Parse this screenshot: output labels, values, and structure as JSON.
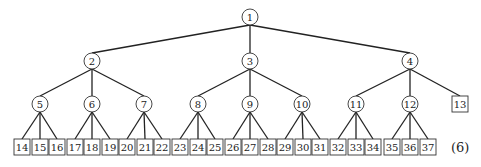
{
  "diagram": {
    "type": "tree",
    "equation_label": "(6)",
    "internal_nodes": [
      {
        "id": "1",
        "x": 250,
        "y": 17,
        "parent": null
      },
      {
        "id": "2",
        "x": 92,
        "y": 61,
        "parent": "1"
      },
      {
        "id": "3",
        "x": 250,
        "y": 61,
        "parent": "1"
      },
      {
        "id": "4",
        "x": 410,
        "y": 61,
        "parent": "1"
      },
      {
        "id": "5",
        "x": 40,
        "y": 104,
        "parent": "2"
      },
      {
        "id": "6",
        "x": 92,
        "y": 104,
        "parent": "2"
      },
      {
        "id": "7",
        "x": 144,
        "y": 104,
        "parent": "2"
      },
      {
        "id": "8",
        "x": 198,
        "y": 104,
        "parent": "3"
      },
      {
        "id": "9",
        "x": 250,
        "y": 104,
        "parent": "3"
      },
      {
        "id": "10",
        "x": 302,
        "y": 104,
        "parent": "3"
      },
      {
        "id": "11",
        "x": 356,
        "y": 104,
        "parent": "4"
      },
      {
        "id": "12",
        "x": 410,
        "y": 104,
        "parent": "4"
      }
    ],
    "leaf_nodes": [
      {
        "id": "13",
        "x": 460,
        "y": 104,
        "parent": "4"
      },
      {
        "id": "14",
        "x": 22,
        "y": 147,
        "parent": "5"
      },
      {
        "id": "15",
        "x": 40,
        "y": 147,
        "parent": "5"
      },
      {
        "id": "16",
        "x": 57,
        "y": 147,
        "parent": "5"
      },
      {
        "id": "17",
        "x": 75,
        "y": 147,
        "parent": "6"
      },
      {
        "id": "18",
        "x": 92,
        "y": 147,
        "parent": "6"
      },
      {
        "id": "19",
        "x": 110,
        "y": 147,
        "parent": "6"
      },
      {
        "id": "20",
        "x": 127,
        "y": 147,
        "parent": "7"
      },
      {
        "id": "21",
        "x": 145,
        "y": 147,
        "parent": "7"
      },
      {
        "id": "22",
        "x": 162,
        "y": 147,
        "parent": "7"
      },
      {
        "id": "23",
        "x": 180,
        "y": 147,
        "parent": "8"
      },
      {
        "id": "24",
        "x": 198,
        "y": 147,
        "parent": "8"
      },
      {
        "id": "25",
        "x": 215,
        "y": 147,
        "parent": "8"
      },
      {
        "id": "26",
        "x": 233,
        "y": 147,
        "parent": "9"
      },
      {
        "id": "27",
        "x": 250,
        "y": 147,
        "parent": "9"
      },
      {
        "id": "28",
        "x": 268,
        "y": 147,
        "parent": "9"
      },
      {
        "id": "29",
        "x": 285,
        "y": 147,
        "parent": "10"
      },
      {
        "id": "30",
        "x": 303,
        "y": 147,
        "parent": "10"
      },
      {
        "id": "31",
        "x": 320,
        "y": 147,
        "parent": "10"
      },
      {
        "id": "32",
        "x": 338,
        "y": 147,
        "parent": "11"
      },
      {
        "id": "33",
        "x": 356,
        "y": 147,
        "parent": "11"
      },
      {
        "id": "34",
        "x": 373,
        "y": 147,
        "parent": "11"
      },
      {
        "id": "35",
        "x": 392,
        "y": 147,
        "parent": "12"
      },
      {
        "id": "36",
        "x": 410,
        "y": 147,
        "parent": "12"
      },
      {
        "id": "37",
        "x": 428,
        "y": 147,
        "parent": "12"
      }
    ]
  }
}
